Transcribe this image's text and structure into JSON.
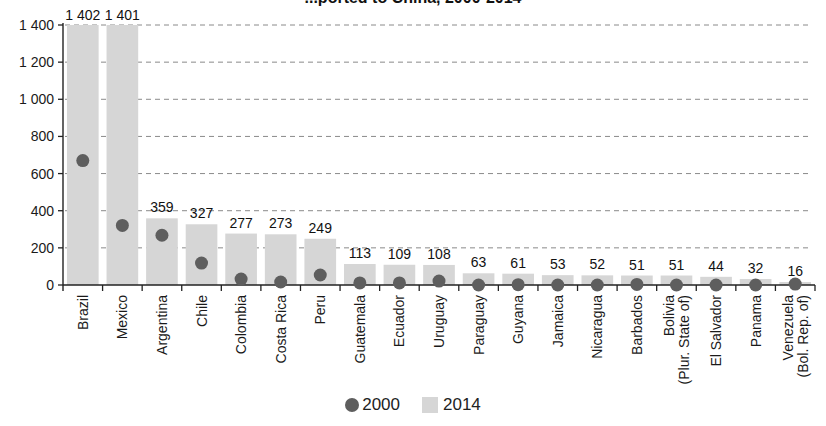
{
  "chart_data": {
    "type": "bar",
    "title": "...ported to China, 2000-2014",
    "xlabel": "",
    "ylabel": "",
    "ylim": [
      0,
      1400
    ],
    "yticks": [
      0,
      200,
      400,
      600,
      800,
      1000,
      1200,
      1400
    ],
    "ytick_labels": [
      "0",
      "200",
      "400",
      "600",
      "800",
      "1 000",
      "1 200",
      "1 400"
    ],
    "grid": "horizontal dashed",
    "legend_position": "bottom-center",
    "categories": [
      "Brazil",
      "Mexico",
      "Argentina",
      "Chile",
      "Colombia",
      "Costa Rica",
      "Peru",
      "Guatemala",
      "Ecuador",
      "Uruguay",
      "Paraguay",
      "Guyana",
      "Jamaica",
      "Nicaragua",
      "Barbados",
      "Bolivia\n(Plur. State of)",
      "El Salvador",
      "Panama",
      "Venezuela\n(Bol. Rep. of)"
    ],
    "series": [
      {
        "name": "2014",
        "type": "bar",
        "color": "#d6d6d6",
        "values": [
          1402,
          1401,
          359,
          327,
          277,
          273,
          249,
          113,
          109,
          108,
          63,
          61,
          53,
          52,
          51,
          51,
          44,
          32,
          16
        ],
        "labels": [
          "1 402",
          "1 401",
          "359",
          "327",
          "277",
          "273",
          "249",
          "113",
          "109",
          "108",
          "63",
          "61",
          "53",
          "52",
          "51",
          "51",
          "44",
          "32",
          "16"
        ]
      },
      {
        "name": "2000",
        "type": "scatter",
        "color": "#5e5e5e",
        "values": [
          670,
          321,
          268,
          118,
          32,
          16,
          54,
          11,
          11,
          21,
          0,
          2,
          0,
          0,
          3,
          0,
          0,
          0,
          5
        ]
      }
    ]
  },
  "legend": {
    "item_2000": "2000",
    "item_2014": "2014"
  }
}
